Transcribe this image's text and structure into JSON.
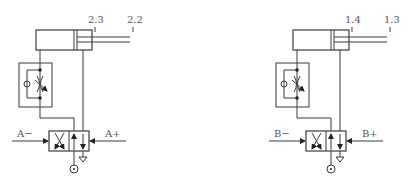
{
  "diagram": {
    "type": "pneumatic-circuit",
    "circuits": [
      {
        "id": "left",
        "cylinder": {
          "port_labels": [
            "2.3",
            "2.2"
          ]
        },
        "valve": {
          "signal_left": "A−",
          "signal_right": "A+"
        }
      },
      {
        "id": "right",
        "cylinder": {
          "port_labels": [
            "1.4",
            "1.3"
          ]
        },
        "valve": {
          "signal_left": "B−",
          "signal_right": "B+"
        }
      }
    ],
    "colors": {
      "line": "#3a3a3a",
      "text": "#555555"
    }
  }
}
